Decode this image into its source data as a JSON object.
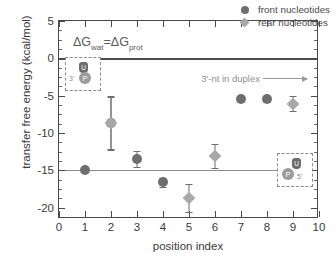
{
  "chart_data": {
    "type": "scatter",
    "title": "",
    "xlabel": "position index",
    "ylabel": "transfer free energy (kcal/mol)",
    "xlim": [
      0,
      10
    ],
    "ylim": [
      -21.5,
      5
    ],
    "xticks": [
      "0",
      "1",
      "2",
      "3",
      "4",
      "5",
      "6",
      "7",
      "8",
      "9",
      "10"
    ],
    "yticks": [
      "5",
      "0",
      "-5",
      "-10",
      "-15",
      "-20"
    ],
    "grid": false,
    "legend_position": "top-right",
    "reference_lines": [
      {
        "name": "zero-line",
        "y": 0,
        "color": "#4d4d4d"
      },
      {
        "name": "minus-fifteen-line",
        "y": -15,
        "color": "#8a8a8a"
      }
    ],
    "series": [
      {
        "name": "front nucleotides",
        "marker": "circle",
        "color": "#6e6e6e",
        "points": [
          {
            "x": 1,
            "y": -15.0,
            "err": 0.25
          },
          {
            "x": 2,
            "y": -8.7,
            "err": 3.5
          },
          {
            "x": 3,
            "y": -13.5,
            "err": 1.1
          },
          {
            "x": 4,
            "y": -16.6,
            "err": 0.6
          },
          {
            "x": 7,
            "y": -5.5,
            "err": 0.4
          },
          {
            "x": 8,
            "y": -5.5,
            "err": 0.4
          }
        ]
      },
      {
        "name": "rear nucleotides",
        "marker": "diamond",
        "color": "#a8a8a8",
        "points": [
          {
            "x": 2,
            "y": -8.6,
            "err": 3.5
          },
          {
            "x": 5,
            "y": -18.7,
            "err": 1.9
          },
          {
            "x": 6,
            "y": -13.1,
            "err": 1.6
          },
          {
            "x": 9,
            "y": -6.1,
            "err": 1.0
          }
        ]
      }
    ],
    "annotations": [
      {
        "name": "free-energy-equality",
        "text": "ΔG wat = ΔG prot"
      },
      {
        "name": "duplex-arrow-label",
        "text": "3'-nt in duplex"
      }
    ]
  },
  "axes": {
    "ylabel": "transfer free energy (kcal/mol)",
    "xlabel": "position index",
    "yticks": [
      "5",
      "0",
      "-5",
      "-10",
      "-15",
      "-20"
    ],
    "xticks": [
      "0",
      "1",
      "2",
      "3",
      "4",
      "5",
      "6",
      "7",
      "8",
      "9",
      "10"
    ]
  },
  "legend": {
    "items": [
      {
        "label": "front nucleotides",
        "marker": "circle"
      },
      {
        "label": "rear nucleotides",
        "marker": "diamond"
      }
    ]
  },
  "annotations": {
    "equality_prefix": "ΔG",
    "equality_sub1": "wat",
    "equality_mid": "=ΔG",
    "equality_sub2": "prot",
    "duplex_label": "3'-nt in duplex"
  },
  "insets": {
    "top_left": {
      "base": "U",
      "phosphate": "P",
      "end_label": "3'"
    },
    "bottom_right": {
      "base": "U",
      "phosphate": "P",
      "end_label": "5'"
    }
  }
}
